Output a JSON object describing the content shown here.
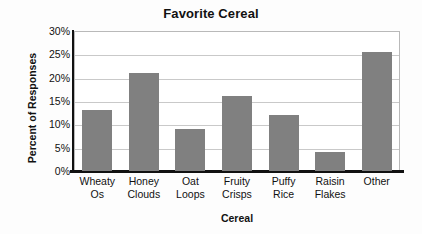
{
  "chart_data": {
    "type": "bar",
    "title": "Favorite Cereal",
    "xlabel": "Cereal",
    "ylabel": "Percent of Responses",
    "categories": [
      "Wheaty Os",
      "Honey Clouds",
      "Oat Loops",
      "Fruity Crisps",
      "Puffy Rice",
      "Raisin Flakes",
      "Other"
    ],
    "category_lines": [
      [
        "Wheaty",
        "Os"
      ],
      [
        "Honey",
        "Clouds"
      ],
      [
        "Oat",
        "Loops"
      ],
      [
        "Fruity",
        "Crisps"
      ],
      [
        "Puffy",
        "Rice"
      ],
      [
        "Raisin",
        "Flakes"
      ],
      [
        "Other"
      ]
    ],
    "values": [
      13,
      21,
      9,
      16,
      12,
      4,
      25.5
    ],
    "ylim": [
      0,
      30
    ],
    "ytick_values": [
      30,
      25,
      20,
      15,
      10,
      5,
      0
    ],
    "ytick_labels": [
      "30%",
      "25%",
      "20%",
      "15%",
      "10%",
      "5%",
      "0%"
    ],
    "grid": true,
    "legend": "none",
    "bar_color": "#808080",
    "gridline_color": "#c9c9c9",
    "axis_color": "#111111",
    "plot_background": "#ffffff"
  }
}
